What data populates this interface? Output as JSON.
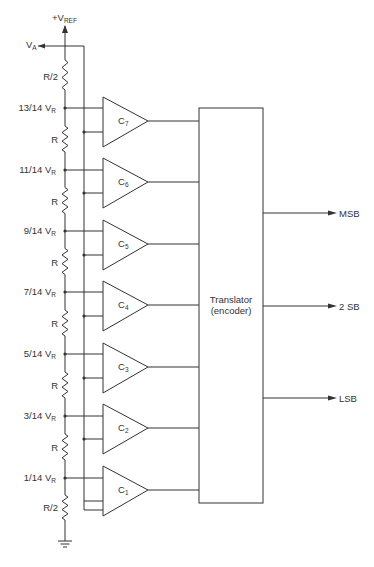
{
  "diagram": {
    "type": "flash-adc-block-diagram",
    "supply_label": "+V",
    "supply_subscript": "REF",
    "input_label": "V",
    "input_subscript": "A",
    "top_resistor_label": "R/2",
    "bottom_resistor_label": "R/2",
    "middle_resistor_label": "R",
    "tap_subscript": "R",
    "taps": [
      {
        "label": "13/14 V",
        "y": 108
      },
      {
        "label": "11/14 V",
        "y": 170
      },
      {
        "label": "9/14 V",
        "y": 231
      },
      {
        "label": "7/14 V",
        "y": 292
      },
      {
        "label": "5/14 V",
        "y": 354
      },
      {
        "label": "3/14 V",
        "y": 416
      },
      {
        "label": "1/14 V",
        "y": 478
      }
    ],
    "comparators": [
      {
        "label": "C",
        "sub": "7",
        "cy": 121
      },
      {
        "label": "C",
        "sub": "6",
        "cy": 182
      },
      {
        "label": "C",
        "sub": "5",
        "cy": 244
      },
      {
        "label": "C",
        "sub": "4",
        "cy": 305
      },
      {
        "label": "C",
        "sub": "3",
        "cy": 367
      },
      {
        "label": "C",
        "sub": "2",
        "cy": 428
      },
      {
        "label": "C",
        "sub": "1",
        "cy": 490
      }
    ],
    "translator": {
      "line1": "Translator",
      "line2": "(encoder)"
    },
    "outputs": [
      {
        "label": "MSB",
        "y": 213
      },
      {
        "label": "2 SB",
        "y": 306
      },
      {
        "label": "LSB",
        "y": 398
      }
    ]
  }
}
